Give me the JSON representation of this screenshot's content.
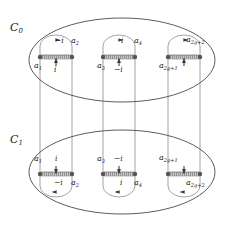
{
  "figure": {
    "colors": {
      "stroke": "#444444",
      "cut_fill": "#b3b3b3",
      "dot": "#555555",
      "text": "#1a1a1a",
      "background": "#ffffff"
    }
  },
  "sheets": [
    {
      "id": "C0",
      "label": "C",
      "label_sub": "0",
      "label_full": "C0",
      "cuts": [
        {
          "id": "cut-a1-a2",
          "left_endpoint": {
            "label": "a",
            "sub": "1",
            "full": "a1",
            "position": "below-left"
          },
          "right_endpoint": {
            "label": "a",
            "sub": "2",
            "full": "a2",
            "position": "above-right"
          },
          "arc_arrow": {
            "label": "-i",
            "position": "above"
          },
          "vertical_arrow": {
            "label": "i",
            "position": "below"
          }
        },
        {
          "id": "cut-a3-a4",
          "left_endpoint": {
            "label": "a",
            "sub": "3",
            "full": "a3",
            "position": "below-left"
          },
          "right_endpoint": {
            "label": "a",
            "sub": "4",
            "full": "a4",
            "position": "above-right"
          },
          "arc_arrow": {
            "label": "i",
            "position": "above"
          },
          "vertical_arrow": {
            "label": "-i",
            "position": "below"
          }
        },
        {
          "id": "cut-a2g1-a2g2",
          "left_endpoint": {
            "label": "a",
            "sub": "2g+1",
            "full": "a2g+1",
            "position": "below-left"
          },
          "right_endpoint": {
            "label": "a",
            "sub": "2g+2",
            "full": "a2g+2",
            "position": "above-right"
          },
          "arc_arrow": {
            "label": "",
            "position": "above"
          },
          "vertical_arrow": {
            "label": "",
            "position": "below"
          }
        }
      ]
    },
    {
      "id": "C1",
      "label": "C",
      "label_sub": "1",
      "label_full": "C1",
      "cuts": [
        {
          "id": "cut-a1-a2",
          "left_endpoint": {
            "label": "a",
            "sub": "1",
            "full": "a1",
            "position": "above-left"
          },
          "right_endpoint": {
            "label": "a",
            "sub": "2",
            "full": "a2",
            "position": "below-right"
          },
          "arc_arrow": {
            "label": "-i",
            "position": "below"
          },
          "vertical_arrow": {
            "label": "i",
            "position": "above"
          }
        },
        {
          "id": "cut-a3-a4",
          "left_endpoint": {
            "label": "a",
            "sub": "3",
            "full": "a3",
            "position": "above-left"
          },
          "right_endpoint": {
            "label": "a",
            "sub": "4",
            "full": "a4",
            "position": "below-right"
          },
          "arc_arrow": {
            "label": "i",
            "position": "below"
          },
          "vertical_arrow": {
            "label": "-i",
            "position": "above"
          }
        },
        {
          "id": "cut-a2g1-a2g2",
          "left_endpoint": {
            "label": "a",
            "sub": "2g+1",
            "full": "a2g+1",
            "position": "above-left"
          },
          "right_endpoint": {
            "label": "a",
            "sub": "2g+2",
            "full": "a2g+2",
            "position": "below-right"
          },
          "arc_arrow": {
            "label": "",
            "position": "below"
          },
          "vertical_arrow": {
            "label": "",
            "position": "above"
          }
        }
      ]
    }
  ],
  "labels": {
    "c0": "C",
    "c0_sub": "0",
    "c1": "C",
    "c1_sub": "1",
    "a1": "a",
    "a1_sub": "1",
    "a2": "a",
    "a2_sub": "2",
    "a3": "a",
    "a3_sub": "3",
    "a4": "a",
    "a4_sub": "4",
    "a2g1": "a",
    "a2g1_sub": "2g+1",
    "a2g2": "a",
    "a2g2_sub": "2g+2",
    "i": "i",
    "minus_i": "−i"
  }
}
